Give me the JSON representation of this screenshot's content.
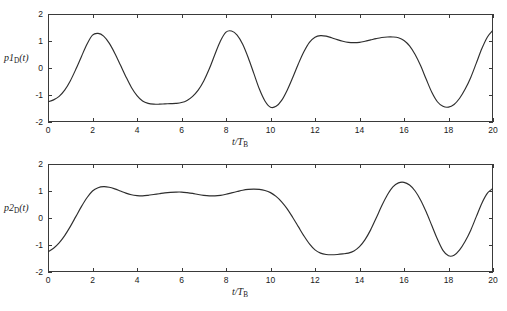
{
  "figure": {
    "background_color": "#ffffff",
    "line_color": "#2e2e2e",
    "axis_color": "#3a3a3a",
    "panel_count": 2
  },
  "chart_data": [
    {
      "type": "line",
      "title": "",
      "xlabel": "t/T_B",
      "xlabel_main": "t/T",
      "xlabel_sub": "B",
      "ylabel": "p1_D(t)",
      "ylabel_main": "p1",
      "ylabel_sub": "D",
      "ylabel_arg": "(t)",
      "xlim": [
        0,
        20
      ],
      "ylim": [
        -2,
        2
      ],
      "grid": false,
      "legend": null,
      "xticks": [
        0,
        2,
        4,
        6,
        8,
        10,
        12,
        14,
        16,
        18,
        20
      ],
      "xticklabels": [
        "0",
        "2",
        "4",
        "6",
        "8",
        "10",
        "12",
        "14",
        "16",
        "18",
        "20"
      ],
      "yticks": [
        -2,
        -1,
        0,
        1,
        2
      ],
      "yticklabels": [
        "-2",
        "-1",
        "0",
        "1",
        "2"
      ],
      "series": [
        {
          "name": "p1D",
          "x": [
            0.0,
            0.25,
            0.5,
            0.75,
            1.0,
            1.25,
            1.5,
            1.75,
            2.0,
            2.25,
            2.5,
            2.75,
            3.0,
            3.25,
            3.5,
            3.75,
            4.0,
            4.25,
            4.5,
            4.75,
            5.0,
            5.25,
            5.5,
            5.75,
            6.0,
            6.25,
            6.5,
            6.75,
            7.0,
            7.25,
            7.5,
            7.75,
            8.0,
            8.25,
            8.5,
            8.75,
            9.0,
            9.25,
            9.5,
            9.75,
            10.0,
            10.25,
            10.5,
            10.75,
            11.0,
            11.25,
            11.5,
            11.75,
            12.0,
            12.25,
            12.5,
            12.75,
            13.0,
            13.25,
            13.5,
            13.75,
            14.0,
            14.25,
            14.5,
            14.75,
            15.0,
            15.25,
            15.5,
            15.75,
            16.0,
            16.25,
            16.5,
            16.75,
            17.0,
            17.25,
            17.5,
            17.75,
            18.0,
            18.25,
            18.5,
            18.75,
            19.0,
            19.25,
            19.5,
            19.75,
            20.0
          ],
          "y": [
            -1.25,
            -1.18,
            -1.05,
            -0.82,
            -0.48,
            -0.05,
            0.42,
            0.88,
            1.22,
            1.28,
            1.18,
            0.92,
            0.55,
            0.12,
            -0.32,
            -0.72,
            -1.02,
            -1.22,
            -1.31,
            -1.34,
            -1.34,
            -1.33,
            -1.32,
            -1.31,
            -1.28,
            -1.2,
            -1.05,
            -0.82,
            -0.48,
            -0.03,
            0.5,
            1.0,
            1.33,
            1.37,
            1.22,
            0.88,
            0.38,
            -0.2,
            -0.78,
            -1.22,
            -1.45,
            -1.42,
            -1.2,
            -0.82,
            -0.35,
            0.15,
            0.6,
            0.95,
            1.14,
            1.2,
            1.18,
            1.12,
            1.05,
            0.99,
            0.95,
            0.94,
            0.95,
            0.99,
            1.04,
            1.09,
            1.13,
            1.15,
            1.15,
            1.12,
            1.02,
            0.82,
            0.5,
            0.08,
            -0.42,
            -0.9,
            -1.25,
            -1.42,
            -1.45,
            -1.35,
            -1.12,
            -0.78,
            -0.35,
            0.18,
            0.72,
            1.15,
            1.4
          ]
        }
      ]
    },
    {
      "type": "line",
      "title": "",
      "xlabel": "t/T_B",
      "xlabel_main": "t/T",
      "xlabel_sub": "B",
      "ylabel": "p2_D(t)",
      "ylabel_main": "p2",
      "ylabel_sub": "D",
      "ylabel_arg": "(t)",
      "xlim": [
        0,
        20
      ],
      "ylim": [
        -2,
        2
      ],
      "grid": false,
      "legend": null,
      "xticks": [
        0,
        2,
        4,
        6,
        8,
        10,
        12,
        14,
        16,
        18,
        20
      ],
      "xticklabels": [
        "0",
        "2",
        "4",
        "6",
        "8",
        "10",
        "12",
        "14",
        "16",
        "18",
        "20"
      ],
      "yticks": [
        -2,
        -1,
        0,
        1,
        2
      ],
      "yticklabels": [
        "-2",
        "-1",
        "0",
        "1",
        "2"
      ],
      "series": [
        {
          "name": "p2D",
          "x": [
            0.0,
            0.25,
            0.5,
            0.75,
            1.0,
            1.25,
            1.5,
            1.75,
            2.0,
            2.25,
            2.5,
            2.75,
            3.0,
            3.25,
            3.5,
            3.75,
            4.0,
            4.25,
            4.5,
            4.75,
            5.0,
            5.25,
            5.5,
            5.75,
            6.0,
            6.25,
            6.5,
            6.75,
            7.0,
            7.25,
            7.5,
            7.75,
            8.0,
            8.25,
            8.5,
            8.75,
            9.0,
            9.25,
            9.5,
            9.75,
            10.0,
            10.25,
            10.5,
            10.75,
            11.0,
            11.25,
            11.5,
            11.75,
            12.0,
            12.25,
            12.5,
            12.75,
            13.0,
            13.25,
            13.5,
            13.75,
            14.0,
            14.25,
            14.5,
            14.75,
            15.0,
            15.25,
            15.5,
            15.75,
            16.0,
            16.25,
            16.5,
            16.75,
            17.0,
            17.25,
            17.5,
            17.75,
            18.0,
            18.25,
            18.5,
            18.75,
            19.0,
            19.25,
            19.5,
            19.75,
            20.0
          ],
          "y": [
            -1.25,
            -1.12,
            -0.92,
            -0.65,
            -0.32,
            0.05,
            0.42,
            0.75,
            1.0,
            1.12,
            1.16,
            1.14,
            1.08,
            1.0,
            0.92,
            0.86,
            0.83,
            0.82,
            0.84,
            0.87,
            0.9,
            0.93,
            0.95,
            0.96,
            0.96,
            0.94,
            0.91,
            0.87,
            0.84,
            0.82,
            0.82,
            0.84,
            0.88,
            0.93,
            0.98,
            1.03,
            1.06,
            1.07,
            1.06,
            1.02,
            0.94,
            0.8,
            0.6,
            0.34,
            0.02,
            -0.32,
            -0.66,
            -0.96,
            -1.18,
            -1.3,
            -1.35,
            -1.36,
            -1.35,
            -1.33,
            -1.3,
            -1.22,
            -1.06,
            -0.8,
            -0.44,
            0.0,
            0.45,
            0.85,
            1.15,
            1.3,
            1.32,
            1.22,
            1.0,
            0.66,
            0.22,
            -0.28,
            -0.78,
            -1.2,
            -1.4,
            -1.38,
            -1.18,
            -0.86,
            -0.45,
            0.05,
            0.55,
            0.92,
            1.1
          ]
        }
      ]
    }
  ]
}
